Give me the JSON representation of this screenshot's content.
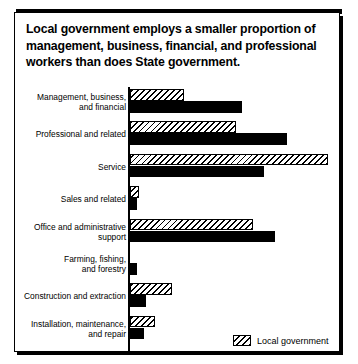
{
  "figure": {
    "title": "Local government employs a smaller proportion of management, business, financial, and professional workers than does State government.",
    "legend": {
      "items": [
        {
          "label": "Local government",
          "pattern": "diagonal-hatch",
          "color": "#000000"
        }
      ]
    },
    "colors": {
      "local_government": "#ffffff",
      "state_government": "#000000",
      "outline": "#000000",
      "background": "#ffffff"
    }
  },
  "chart_data": {
    "type": "bar",
    "orientation": "horizontal",
    "title": "Local government employs a smaller proportion of management, business, financial, and professional workers than does State government.",
    "xlabel": "",
    "ylabel": "",
    "grid": false,
    "legend_position": "bottom-right",
    "axis_labels_shown": false,
    "xlim": [
      0,
      45
    ],
    "categories": [
      "Management, business, and financial",
      "Professional and related",
      "Service",
      "Sales and related",
      "Office and administrative support",
      "Farming, fishing, and forestry",
      "Construction and extraction",
      "Installation, maintenance, and repair"
    ],
    "series": [
      {
        "name": "Local government",
        "pattern": "diagonal-hatch",
        "values": [
          9.6,
          19.0,
          36.0,
          1.5,
          23.0,
          0.0,
          7.5,
          4.4
        ]
      },
      {
        "name": "State government",
        "pattern": "solid",
        "values": [
          19.8,
          27.9,
          23.7,
          1.2,
          27.1,
          1.2,
          2.9,
          2.6
        ]
      }
    ]
  },
  "rows": [
    {
      "label_line1": "Management, business,",
      "label_line2": "and financial",
      "local_px": 54,
      "state_px": 112
    },
    {
      "label_line1": "Professional and related",
      "label_line2": "",
      "local_px": 106,
      "state_px": 157
    },
    {
      "label_line1": "Service",
      "label_line2": "",
      "local_px": 198,
      "state_px": 134
    },
    {
      "label_line1": "Sales and related",
      "label_line2": "",
      "local_px": 9,
      "state_px": 7
    },
    {
      "label_line1": "Office and administrative",
      "label_line2": "support",
      "local_px": 123,
      "state_px": 145
    },
    {
      "label_line1": "Farming, fishing,",
      "label_line2": "and forestry",
      "local_px": 0,
      "state_px": 7
    },
    {
      "label_line1": "Construction and extraction",
      "label_line2": "",
      "local_px": 42,
      "state_px": 16
    },
    {
      "label_line1": "Installation, maintenance,",
      "label_line2": "and repair",
      "local_px": 25,
      "state_px": 14
    }
  ]
}
